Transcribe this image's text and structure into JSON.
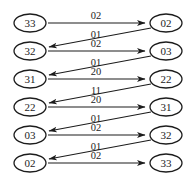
{
  "diagram": {
    "type": "state-transition-trellis",
    "colors": {
      "background": "#ffffff",
      "stroke": "#1c1c1c",
      "text": "#1c1c1c"
    },
    "left_nodes": [
      "33",
      "32",
      "31",
      "22",
      "03",
      "02"
    ],
    "right_nodes": [
      "02",
      "03",
      "22",
      "31",
      "32",
      "33"
    ],
    "edges": [
      {
        "kind": "forward",
        "row": 0,
        "from": "33",
        "to": "02",
        "label": "02"
      },
      {
        "kind": "back",
        "row": 0,
        "from": "02",
        "to": "32",
        "label": "01"
      },
      {
        "kind": "forward",
        "row": 1,
        "from": "32",
        "to": "03",
        "label": "02"
      },
      {
        "kind": "back",
        "row": 1,
        "from": "03",
        "to": "31",
        "label": "01"
      },
      {
        "kind": "forward",
        "row": 2,
        "from": "31",
        "to": "22",
        "label": "20"
      },
      {
        "kind": "back",
        "row": 2,
        "from": "22",
        "to": "22",
        "label": "11"
      },
      {
        "kind": "forward",
        "row": 3,
        "from": "22",
        "to": "31",
        "label": "20"
      },
      {
        "kind": "back",
        "row": 3,
        "from": "31",
        "to": "03",
        "label": "01"
      },
      {
        "kind": "forward",
        "row": 4,
        "from": "03",
        "to": "32",
        "label": "02"
      },
      {
        "kind": "back",
        "row": 4,
        "from": "32",
        "to": "02",
        "label": "01"
      },
      {
        "kind": "forward",
        "row": 5,
        "from": "02",
        "to": "33",
        "label": "02"
      }
    ]
  }
}
